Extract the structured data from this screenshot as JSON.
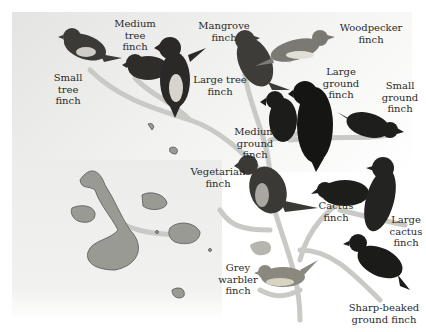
{
  "labels": {
    "small_tree_finch": "Small\ntree\nfinch",
    "medium_tree_finch": "Medium\ntree\nfinch",
    "large_tree_finch": "Large tree\nfinch",
    "mangrove_finch": "Mangrove\nfinch",
    "woodpecker_finch": "Woodpecker\nfinch",
    "large_ground_finch": "Large\nground\nfinch",
    "small_ground_finch": "Small\nground\nfinch",
    "medium_ground_finch": "Medium\nground finch",
    "vegetarian_finch": "Vegetarian\nfinch",
    "cactus_finch": "Cactus\nfinch",
    "large_cactus_finch": "Large\ncactus\nfinch",
    "grey_warbler_finch": "Grey\nwarbler\nfinch",
    "sharp_beaked_ground_finch": "Sharp-beaked\nground finch"
  },
  "colors": {
    "branch": "#c9c9c6",
    "dark_bird": "#1e1e1e",
    "mid_bird": "#4a4a46",
    "light_bird": "#8d8b84",
    "island": "#8a8a86"
  }
}
